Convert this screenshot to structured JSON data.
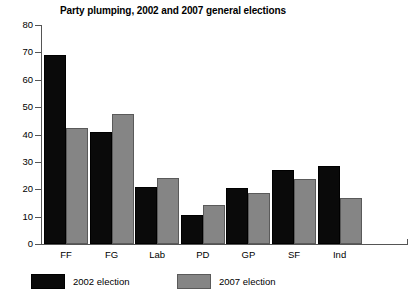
{
  "chart_data": {
    "type": "bar",
    "title": "Party plumping, 2002 and 2007 general elections",
    "xlabel": "",
    "ylabel": "",
    "categories": [
      "FF",
      "FG",
      "Lab",
      "PD",
      "GP",
      "SF",
      "Ind"
    ],
    "series": [
      {
        "name": "2002 election",
        "color": "#0a0a0a",
        "values": [
          69,
          41,
          20.8,
          10.6,
          20.4,
          27,
          28.5
        ]
      },
      {
        "name": "2007 election",
        "color": "#858585",
        "values": [
          42.5,
          47.5,
          24.2,
          14.2,
          18.6,
          23.7,
          16.9
        ]
      }
    ],
    "ylim": [
      0,
      80
    ],
    "yticks": [
      0,
      10,
      20,
      30,
      40,
      50,
      60,
      70,
      80
    ],
    "ytick_labels": [
      "0",
      "10",
      "20",
      "30",
      "40",
      "50",
      "60",
      "70",
      "80"
    ],
    "grid": false,
    "legend_position": "bottom-left",
    "legend": [
      "2002 election",
      "2007 election"
    ]
  }
}
